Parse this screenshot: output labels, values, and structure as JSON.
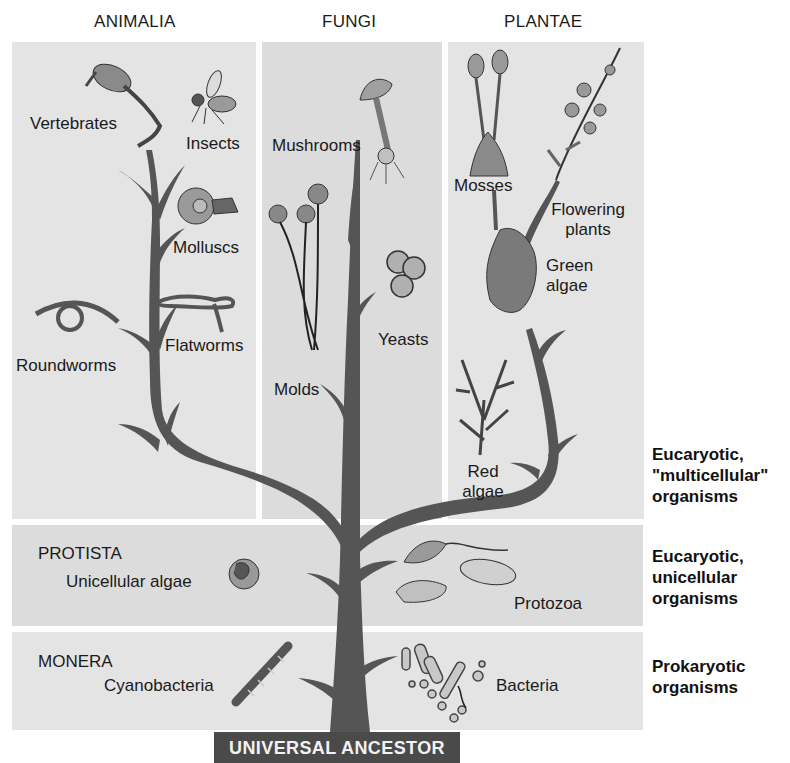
{
  "kingdoms": {
    "animalia": {
      "title": "ANIMALIA",
      "groups": [
        "Vertebrates",
        "Insects",
        "Molluscs",
        "Flatworms",
        "Roundworms"
      ]
    },
    "fungi": {
      "title": "FUNGI",
      "groups": [
        "Mushrooms",
        "Yeasts",
        "Molds"
      ]
    },
    "plantae": {
      "title": "PLANTAE",
      "groups": [
        "Mosses",
        "Flowering plants",
        "Green algae",
        "Red algae"
      ],
      "flowering_line1": "Flowering",
      "flowering_line2": "plants",
      "green_line1": "Green",
      "green_line2": "algae",
      "red_line1": "Red",
      "red_line2": "algae"
    },
    "protista": {
      "title": "PROTISTA",
      "groups": [
        "Unicellular algae",
        "Protozoa"
      ]
    },
    "monera": {
      "title": "MONERA",
      "groups": [
        "Cyanobacteria",
        "Bacteria"
      ]
    }
  },
  "levels": {
    "multicellular": [
      "Eucaryotic,",
      "\"multicellular\"",
      "organisms"
    ],
    "unicellular": [
      "Eucaryotic,",
      "unicellular",
      "organisms"
    ],
    "prokaryotic": [
      "Prokaryotic",
      "organisms"
    ]
  },
  "root": "UNIVERSAL ANCESTOR",
  "colors": {
    "panel": "#e4e4e4",
    "tree": "#555555",
    "root_box": "#4a4a4a",
    "root_text": "#f2f2f2"
  }
}
